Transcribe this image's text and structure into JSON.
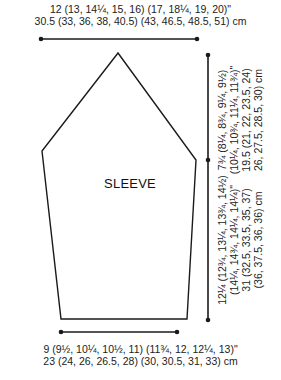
{
  "diagram": {
    "title": "SLEEVE",
    "top_width": {
      "inches": "12 (13, 14¼, 15, 16) (17, 18¼, 19, 20)\"",
      "cm": "30.5 (33, 36, 38, 40.5) (43, 46.5, 48.5, 51) cm"
    },
    "cap_height": {
      "inches_line1": "7¾ (8¼, 8¾, 9¼, 9½)",
      "inches_line2": "(10¼, 10¾, 11¼, 11¾)\"",
      "cm_line1": "19.5 (21, 22, 23.5, 24)",
      "cm_line2": "26, 27.5, 28.5, 30) cm"
    },
    "body_length": {
      "inches_line1": "12¼ (12¾, 13¼, 13¾, 14½)",
      "inches_line2": "(14¼, 14¾, 14¼, 14¼)\"",
      "cm_line1": "31 (32.5, 33.5, 35, 37)",
      "cm_line2": "(36, 37.5, 36, 36) cm"
    },
    "bottom_width": {
      "inches": "9 (9½, 10¼, 10½, 11) (11¾, 12, 12¼, 13)\"",
      "cm": "23 (24, 26, 26.5, 28) (30, 30.5, 31, 33) cm"
    },
    "colors": {
      "line": "#1a1a1a",
      "text": "#222222"
    }
  }
}
